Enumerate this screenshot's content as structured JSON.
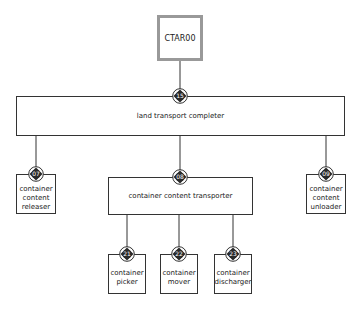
{
  "diagram": {
    "type": "hierarchy",
    "root": {
      "id": "CTAR00",
      "label": "CTAR00"
    },
    "level1": {
      "badge": "15",
      "label": "land transport completer"
    },
    "level2": [
      {
        "badge": "07",
        "label_lines": [
          "container",
          "content",
          "releaser"
        ]
      },
      {
        "badge": "08",
        "label": "container content transporter"
      },
      {
        "badge": "09",
        "label_lines": [
          "container",
          "content",
          "unloader"
        ]
      }
    ],
    "level3": [
      {
        "badge": "21",
        "label_lines": [
          "container",
          "picker"
        ]
      },
      {
        "badge": "22",
        "label_lines": [
          "container",
          "mover"
        ]
      },
      {
        "badge": "23",
        "label_lines": [
          "container",
          "discharger"
        ]
      }
    ],
    "colors": {
      "line": "#333333",
      "root_border": "#999999",
      "badge_fill": "#2a2a2a",
      "badge_text": "#ffffff"
    }
  }
}
